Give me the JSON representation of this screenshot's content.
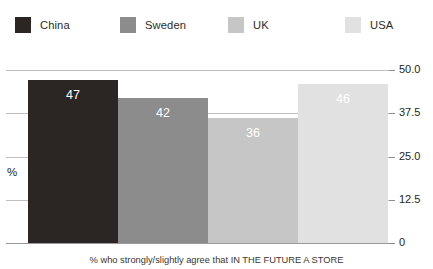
{
  "legend": {
    "items": [
      {
        "label": "China",
        "color": "#2b2624"
      },
      {
        "label": "Sweden",
        "color": "#8c8c8c"
      },
      {
        "label": "UK",
        "color": "#c6c6c6"
      },
      {
        "label": "USA",
        "color": "#e1e1e1"
      }
    ]
  },
  "axis": {
    "y_title": "%",
    "ticks": [
      {
        "label": "50.0",
        "value": 50
      },
      {
        "label": "37.5",
        "value": 37.5
      },
      {
        "label": "25.0",
        "value": 25
      },
      {
        "label": "12.5",
        "value": 12.5
      },
      {
        "label": "0",
        "value": 0
      }
    ]
  },
  "caption": "% who strongly/slightly agree that IN THE FUTURE A STORE",
  "chart_data": {
    "type": "bar",
    "title": "",
    "subtitle": "",
    "xlabel": "",
    "ylabel": "%",
    "categories": [
      "China",
      "Sweden",
      "UK",
      "USA"
    ],
    "values": [
      47,
      42,
      36,
      46
    ],
    "value_labels": [
      "47",
      "42",
      "36",
      "46"
    ],
    "series": [
      {
        "name": "% who strongly/slightly agree",
        "values": [
          47,
          42,
          36,
          46
        ]
      }
    ],
    "colors": [
      "#2b2624",
      "#8c8c8c",
      "#c6c6c6",
      "#e1e1e1"
    ],
    "ylim": [
      0,
      50
    ],
    "yticks": [
      0,
      12.5,
      25,
      37.5,
      50
    ],
    "ytick_labels": [
      "0",
      "12.5",
      "25.0",
      "37.5",
      "50.0"
    ],
    "grid": true,
    "grid_axis": "y",
    "axis_position": "right",
    "legend": true,
    "legend_position": "top",
    "bar_gap": 0,
    "data_labels": true,
    "data_label_color": "#ffffff"
  }
}
